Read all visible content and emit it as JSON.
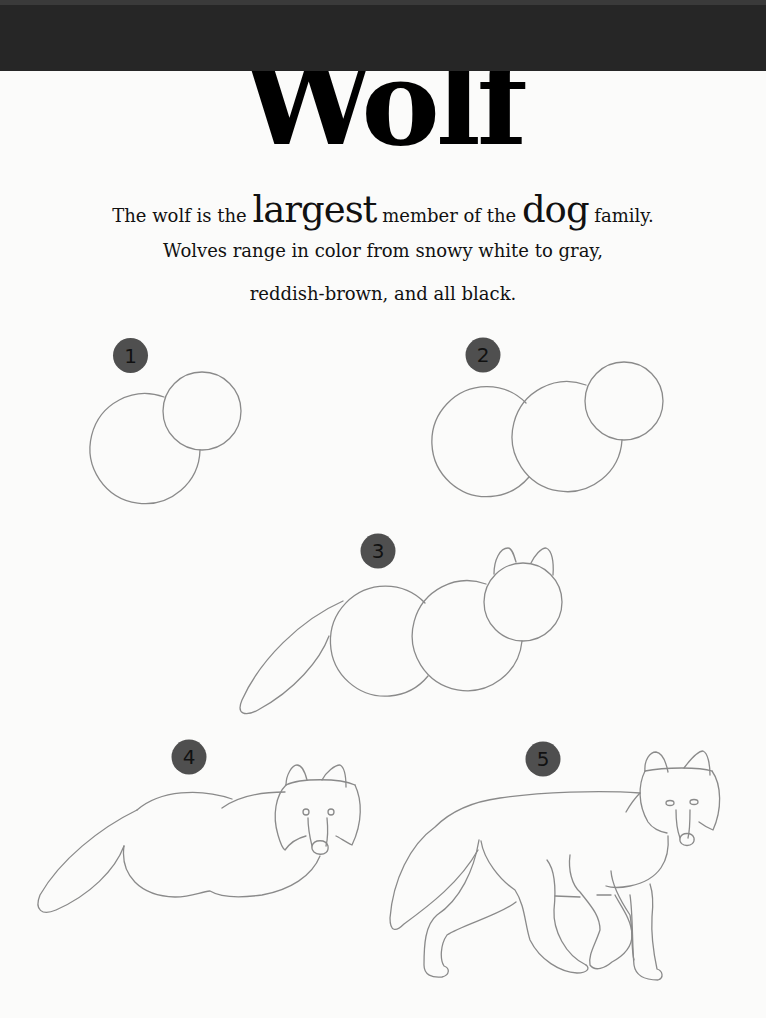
{
  "header": {
    "title": "Wolf",
    "band_color": "#262626"
  },
  "intro": {
    "line1": {
      "part1": "The wolf is the ",
      "emphasis1": "largest",
      "part2": " member of the ",
      "emphasis2": "dog",
      "part3": " family."
    },
    "line2": "Wolves range in color from snowy white to gray,",
    "line3": "reddish-brown, and all black."
  },
  "steps": [
    {
      "number": "1",
      "description": "Two overlapping circles: body and head"
    },
    {
      "number": "2",
      "description": "Three circles: hindquarters, chest, head"
    },
    {
      "number": "3",
      "description": "Add ears and a long tail"
    },
    {
      "number": "4",
      "description": "Shape the body and add face details"
    },
    {
      "number": "5",
      "description": "Add legs and finish the wolf"
    }
  ],
  "style": {
    "badge_color": "#4f4f4f",
    "stroke_color": "#8a8a8a",
    "text_color": "#111111"
  }
}
